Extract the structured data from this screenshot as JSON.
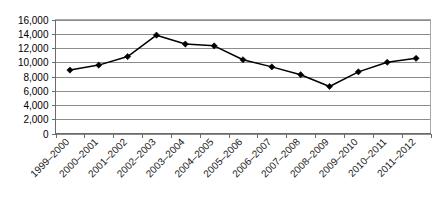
{
  "chart_data": {
    "type": "line",
    "title": "",
    "xlabel": "",
    "ylabel": "",
    "categories": [
      "1999–2000",
      "2000–2001",
      "2001–2002",
      "2002–2003",
      "2003–2004",
      "2004–2005",
      "2005–2006",
      "2006–2007",
      "2007–2008",
      "2008–2009",
      "2009–2010",
      "2010–2011",
      "2011–2012"
    ],
    "values": [
      8900,
      9600,
      10800,
      13800,
      12550,
      12300,
      10350,
      9350,
      8250,
      6600,
      8650,
      10000,
      10550
    ],
    "ylim": [
      0,
      16000
    ],
    "ytick_values": [
      0,
      2000,
      4000,
      6000,
      8000,
      10000,
      12000,
      14000,
      16000
    ],
    "ytick_labels": [
      "0",
      "2,000",
      "4,000",
      "6,000",
      "8,000",
      "10,000",
      "12,000",
      "14,000",
      "16,000"
    ],
    "grid": true,
    "legend": false,
    "legend_position": "none",
    "series_color": "#000000",
    "gridline_color": "#8c8c8c",
    "marker": "diamond",
    "xlabel_rotation": 45
  }
}
